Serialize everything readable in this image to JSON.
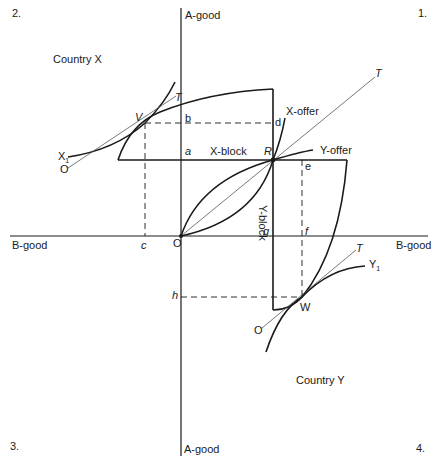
{
  "quadrants": {
    "q1": "1.",
    "q2": "2.",
    "q3": "3.",
    "q4": "4."
  },
  "axes": {
    "a_good_top": "A-good",
    "a_good_bottom": "A-good",
    "b_good_left": "B-good",
    "b_good_right": "B-good"
  },
  "countries": {
    "x": "Country X",
    "y": "Country Y"
  },
  "blocks": {
    "x_block": "X-block",
    "y_block": "Y-block"
  },
  "offers": {
    "x_offer": "X-offer",
    "y_offer": "Y-offer"
  },
  "points": {
    "origin": "O",
    "R": "R",
    "V": "V",
    "W": "W",
    "a": "a",
    "b": "b",
    "c": "c",
    "d": "d",
    "e": "e",
    "f": "f",
    "g": "g",
    "h": "h",
    "T_main": "T",
    "T_x": "T",
    "T_y": "T",
    "O_x": "O",
    "O_y": "O",
    "X1": "X",
    "X1_sub": "1",
    "Y1": "Y",
    "Y1_sub": "1"
  },
  "colors": {
    "ink": "#1a1a1a",
    "thin": "#555555"
  }
}
